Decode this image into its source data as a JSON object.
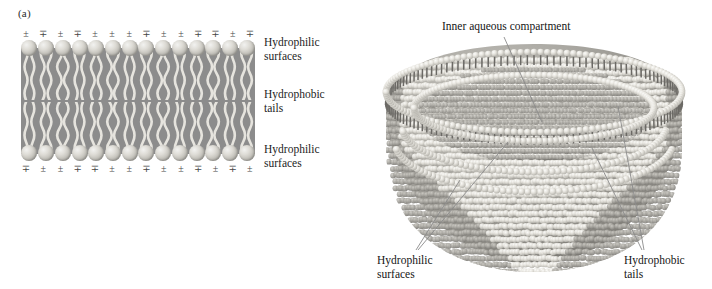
{
  "figure": {
    "panels": [
      {
        "id": "a",
        "letter": "(a)",
        "caption_subject": "lipid bilayer cross-section"
      },
      {
        "id": "b",
        "letter": "(b)",
        "caption_subject": "cut-away liposome vesicle"
      }
    ]
  },
  "panel_a": {
    "letter": "(a)",
    "labels": {
      "hydrophilic_top": "Hydrophilic\nsurfaces",
      "hydrophobic_middle": "Hydrophobic\ntails",
      "hydrophilic_bottom": "Hydrophilic\nsurfaces"
    },
    "charge_symbols_top": [
      "±",
      "∓",
      "±",
      "∓",
      "±",
      "±",
      "±",
      "∓",
      "±",
      "±",
      "∓",
      "∓",
      "±",
      "∓"
    ],
    "charge_symbols_bottom": [
      "∓",
      "±",
      "±",
      "∓",
      "∓",
      "±",
      "±",
      "∓",
      "±",
      "±",
      "∓",
      "±",
      "∓",
      "±"
    ],
    "head_count_per_row": 14,
    "leaflets": 2,
    "colors": {
      "hydrophobic_slab": "#8c8c8c",
      "head_group": "#dedcd6",
      "tail_strand": "#e6e4de",
      "text": "#1d1d1d",
      "charge_text": "#474747"
    }
  },
  "panel_b": {
    "letter": "(b)",
    "labels": {
      "inner_compartment": "Inner aqueous compartment",
      "hydrophilic_surfaces": "Hydrophilic\nsurfaces",
      "hydrophobic_tails": "Hydrophobic\ntails"
    },
    "leader_lines": [
      {
        "label": "inner_compartment",
        "count": 1
      },
      {
        "label": "hydrophilic_surfaces",
        "count": 2
      },
      {
        "label": "hydrophobic_tails",
        "count": 2
      }
    ],
    "colors": {
      "vesicle_body": "#a3a19b",
      "vesicle_shadow": "#6f6d68",
      "head_group": "#eceae4",
      "tail_dark": "#6b6965",
      "leader_line": "#8b8b8b",
      "text": "#151515"
    }
  }
}
